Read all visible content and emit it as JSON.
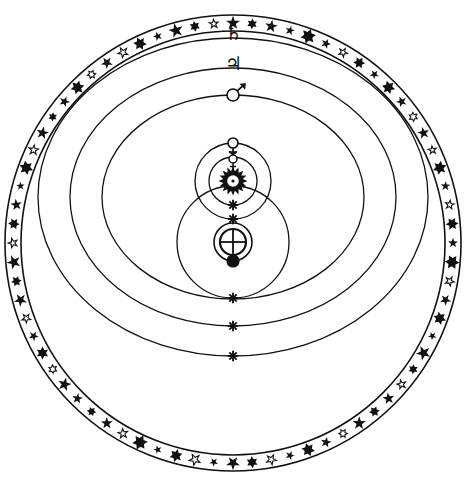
{
  "figure": {
    "name": "tychonic-system-diagram",
    "background_color": "#ffffff",
    "ink_color": "#111111",
    "width": 467,
    "height": 479
  },
  "geometry": {
    "center": {
      "x": 233,
      "y": 197
    },
    "earth": {
      "x": 233,
      "y": 242
    }
  },
  "star_ring": {
    "name": "fixed-stars-band",
    "label": "Sphere of the Fixed Stars",
    "outer_radius": 228,
    "inner_radius": 212,
    "center_x": 233,
    "center_y": 243,
    "star_count": 72
  },
  "orbits": [
    {
      "name": "saturn-orbit",
      "label": "Saturn",
      "symbol": "♄",
      "symbol_name": "saturn-glyph",
      "cx": 233,
      "cy": 197,
      "rx": 195,
      "ry": 159,
      "stroke_width": 1.3,
      "marker_top_y": 38,
      "marker_bottom_y": 356,
      "bottom_marker": "asterisk"
    },
    {
      "name": "jupiter-orbit",
      "label": "Jupiter",
      "symbol": "♃",
      "symbol_name": "jupiter-glyph",
      "cx": 233,
      "cy": 197,
      "rx": 163,
      "ry": 129,
      "stroke_width": 1.3,
      "marker_top_y": 68,
      "marker_bottom_y": 326,
      "bottom_marker": "asterisk"
    },
    {
      "name": "mars-orbit",
      "label": "Mars",
      "symbol": "♂",
      "symbol_name": "mars-glyph",
      "cx": 233,
      "cy": 197,
      "rx": 131,
      "ry": 102,
      "stroke_width": 1.3,
      "marker_top_y": 95,
      "marker_bottom_y": 299,
      "bottom_marker": "mars-circle"
    },
    {
      "name": "sun-orbit-around-earth",
      "label": "Sun orbit about the Earth",
      "symbol": "",
      "symbol_name": "sun-orbit-path",
      "cx": 233,
      "cy": 242,
      "rx": 56,
      "ry": 56,
      "stroke_width": 1.3,
      "marker_top_y": 186,
      "marker_bottom_y": 298,
      "bottom_marker": "asterisk"
    },
    {
      "name": "venus-orbit",
      "label": "Venus",
      "symbol": "♀",
      "symbol_name": "venus-glyph",
      "cx": 233,
      "cy": 181,
      "rx": 38,
      "ry": 38,
      "stroke_width": 1.3,
      "marker_top_y": 143,
      "marker_bottom_y": 219,
      "bottom_marker": "asterisk"
    },
    {
      "name": "mercury-orbit",
      "label": "Mercury",
      "symbol": "☿",
      "symbol_name": "mercury-glyph",
      "cx": 233,
      "cy": 181,
      "rx": 24,
      "ry": 24,
      "stroke_width": 1.3,
      "marker_top_y": 157,
      "marker_bottom_y": 205,
      "bottom_marker": "asterisk"
    },
    {
      "name": "lunar-orbit",
      "label": "Moon",
      "symbol": "●",
      "symbol_name": "moon-glyph",
      "cx": 233,
      "cy": 242,
      "rx": 19,
      "ry": 19,
      "stroke_width": 1.6,
      "marker_top_y": 223,
      "marker_bottom_y": 261,
      "bottom_marker": "moon-disc"
    }
  ],
  "bodies": [
    {
      "name": "sun-body",
      "label": "Sol",
      "symbol": "☉",
      "x": 233,
      "y": 181,
      "radius": 9,
      "style": "sunburst"
    },
    {
      "name": "earth-body",
      "label": "Terra",
      "symbol": "⊕",
      "x": 233,
      "y": 242,
      "radius": 13,
      "style": "earth-cross"
    },
    {
      "name": "moon-body",
      "label": "Luna",
      "symbol": "●",
      "x": 233,
      "y": 261,
      "radius": 6,
      "style": "filled-disc"
    },
    {
      "name": "venus-body",
      "label": "Venus",
      "symbol": "♀",
      "x": 233,
      "y": 143,
      "radius": 5,
      "style": "open-disc-with-cross"
    },
    {
      "name": "mercury-body",
      "label": "Mercury",
      "symbol": "☿",
      "x": 233,
      "y": 159,
      "radius": 4,
      "style": "open-disc-with-horns"
    },
    {
      "name": "mars-body",
      "label": "Mars",
      "symbol": "♂",
      "x": 233,
      "y": 95,
      "radius": 6,
      "style": "open-disc-with-arrow"
    }
  ],
  "labels": {
    "saturn": "♄",
    "jupiter": "♃",
    "mars": "♂",
    "venus": "♀",
    "mercury": "☿",
    "sun": "☉",
    "earth": "⊕",
    "moon": "☽"
  },
  "stars": [
    {
      "a": 0,
      "r": 220,
      "s": 7.2,
      "t": "filled5"
    },
    {
      "a": 5,
      "r": 220,
      "s": 5.4,
      "t": "filled6"
    },
    {
      "a": 10,
      "r": 220,
      "s": 6.6,
      "t": "filled5"
    },
    {
      "a": 15,
      "r": 220,
      "s": 5.0,
      "t": "filled5"
    },
    {
      "a": 20,
      "r": 220,
      "s": 7.8,
      "t": "filled6"
    },
    {
      "a": 25,
      "r": 220,
      "s": 5.2,
      "t": "filled5"
    },
    {
      "a": 30,
      "r": 220,
      "s": 4.6,
      "t": "open5"
    },
    {
      "a": 35,
      "r": 220,
      "s": 6.0,
      "t": "filled6"
    },
    {
      "a": 40,
      "r": 220,
      "s": 4.8,
      "t": "filled5"
    },
    {
      "a": 45,
      "r": 220,
      "s": 6.8,
      "t": "filled6"
    },
    {
      "a": 50,
      "r": 220,
      "s": 5.6,
      "t": "filled5"
    },
    {
      "a": 55,
      "r": 220,
      "s": 4.4,
      "t": "open6"
    },
    {
      "a": 60,
      "r": 220,
      "s": 6.2,
      "t": "filled5"
    },
    {
      "a": 65,
      "r": 220,
      "s": 4.2,
      "t": "open5"
    },
    {
      "a": 70,
      "r": 220,
      "s": 7.0,
      "t": "filled6"
    },
    {
      "a": 75,
      "r": 220,
      "s": 5.0,
      "t": "filled5"
    },
    {
      "a": 80,
      "r": 220,
      "s": 4.6,
      "t": "open5"
    },
    {
      "a": 85,
      "r": 220,
      "s": 6.4,
      "t": "filled6"
    },
    {
      "a": 90,
      "r": 220,
      "s": 5.2,
      "t": "filled5"
    },
    {
      "a": 95,
      "r": 220,
      "s": 7.4,
      "t": "filled6"
    },
    {
      "a": 100,
      "r": 220,
      "s": 4.8,
      "t": "open5"
    },
    {
      "a": 105,
      "r": 220,
      "s": 5.8,
      "t": "filled5"
    },
    {
      "a": 110,
      "r": 220,
      "s": 6.6,
      "t": "filled6"
    },
    {
      "a": 115,
      "r": 220,
      "s": 4.4,
      "t": "filled5"
    },
    {
      "a": 120,
      "r": 220,
      "s": 7.6,
      "t": "filled5"
    },
    {
      "a": 125,
      "r": 220,
      "s": 5.0,
      "t": "filled6"
    },
    {
      "a": 130,
      "r": 220,
      "s": 4.6,
      "t": "open5"
    },
    {
      "a": 135,
      "r": 220,
      "s": 6.2,
      "t": "filled5"
    },
    {
      "a": 140,
      "r": 220,
      "s": 5.4,
      "t": "filled6"
    },
    {
      "a": 145,
      "r": 220,
      "s": 7.0,
      "t": "filled5"
    },
    {
      "a": 150,
      "r": 220,
      "s": 4.2,
      "t": "open6"
    },
    {
      "a": 155,
      "r": 220,
      "s": 5.6,
      "t": "filled5"
    },
    {
      "a": 160,
      "r": 220,
      "s": 6.8,
      "t": "filled6"
    },
    {
      "a": 165,
      "r": 220,
      "s": 4.8,
      "t": "filled5"
    },
    {
      "a": 170,
      "r": 220,
      "s": 5.2,
      "t": "open5"
    },
    {
      "a": 175,
      "r": 220,
      "s": 6.0,
      "t": "filled6"
    },
    {
      "a": 180,
      "r": 220,
      "s": 7.2,
      "t": "filled5"
    },
    {
      "a": 185,
      "r": 220,
      "s": 4.6,
      "t": "filled5"
    },
    {
      "a": 190,
      "r": 220,
      "s": 5.8,
      "t": "open5"
    },
    {
      "a": 195,
      "r": 220,
      "s": 6.6,
      "t": "filled6"
    },
    {
      "a": 200,
      "r": 220,
      "s": 4.4,
      "t": "filled5"
    },
    {
      "a": 205,
      "r": 220,
      "s": 7.8,
      "t": "filled6"
    },
    {
      "a": 210,
      "r": 220,
      "s": 5.0,
      "t": "open5"
    },
    {
      "a": 215,
      "r": 220,
      "s": 6.2,
      "t": "filled5"
    },
    {
      "a": 220,
      "r": 220,
      "s": 4.8,
      "t": "filled6"
    },
    {
      "a": 225,
      "r": 220,
      "s": 5.6,
      "t": "filled5"
    },
    {
      "a": 230,
      "r": 220,
      "s": 7.0,
      "t": "filled5"
    },
    {
      "a": 235,
      "r": 220,
      "s": 4.2,
      "t": "open6"
    },
    {
      "a": 240,
      "r": 220,
      "s": 6.4,
      "t": "filled6"
    },
    {
      "a": 245,
      "r": 220,
      "s": 5.2,
      "t": "filled5"
    },
    {
      "a": 250,
      "r": 220,
      "s": 4.6,
      "t": "open5"
    },
    {
      "a": 255,
      "r": 220,
      "s": 6.8,
      "t": "filled5"
    },
    {
      "a": 260,
      "r": 220,
      "s": 5.4,
      "t": "filled6"
    },
    {
      "a": 265,
      "r": 220,
      "s": 7.4,
      "t": "filled5"
    },
    {
      "a": 270,
      "r": 220,
      "s": 4.8,
      "t": "open5"
    },
    {
      "a": 275,
      "r": 220,
      "s": 5.8,
      "t": "filled6"
    },
    {
      "a": 280,
      "r": 220,
      "s": 6.0,
      "t": "filled5"
    },
    {
      "a": 285,
      "r": 220,
      "s": 4.4,
      "t": "filled5"
    },
    {
      "a": 290,
      "r": 220,
      "s": 7.2,
      "t": "filled6"
    },
    {
      "a": 295,
      "r": 220,
      "s": 5.0,
      "t": "open5"
    },
    {
      "a": 300,
      "r": 220,
      "s": 6.6,
      "t": "filled5"
    },
    {
      "a": 305,
      "r": 220,
      "s": 4.6,
      "t": "filled6"
    },
    {
      "a": 310,
      "r": 220,
      "s": 5.6,
      "t": "filled5"
    },
    {
      "a": 315,
      "r": 220,
      "s": 7.0,
      "t": "filled6"
    },
    {
      "a": 320,
      "r": 220,
      "s": 4.2,
      "t": "open6"
    },
    {
      "a": 325,
      "r": 220,
      "s": 6.2,
      "t": "filled5"
    },
    {
      "a": 330,
      "r": 220,
      "s": 5.2,
      "t": "open5"
    },
    {
      "a": 335,
      "r": 220,
      "s": 6.8,
      "t": "filled6"
    },
    {
      "a": 340,
      "r": 220,
      "s": 4.8,
      "t": "filled5"
    },
    {
      "a": 345,
      "r": 220,
      "s": 7.6,
      "t": "filled5"
    },
    {
      "a": 350,
      "r": 220,
      "s": 5.4,
      "t": "filled6"
    },
    {
      "a": 355,
      "r": 220,
      "s": 4.6,
      "t": "open5"
    }
  ]
}
